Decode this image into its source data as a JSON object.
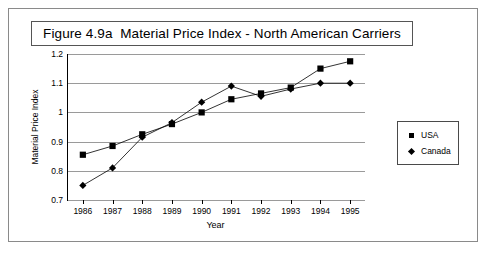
{
  "figure": {
    "title": "Figure 4.9a  Material Price Index - North American Carriers"
  },
  "legend": {
    "items": [
      {
        "label": "USA",
        "marker": "square-marker",
        "color": "#000000"
      },
      {
        "label": "Canada",
        "marker": "diamond-marker",
        "color": "#000000"
      }
    ]
  },
  "chart_data": {
    "type": "line",
    "title": "Figure 4.9a  Material Price Index - North American Carriers",
    "xlabel": "Year",
    "ylabel": "Material Price Index",
    "categories": [
      "1986",
      "1987",
      "1988",
      "1989",
      "1990",
      "1991",
      "1992",
      "1993",
      "1994",
      "1995"
    ],
    "x": [
      1986,
      1987,
      1988,
      1989,
      1990,
      1991,
      1992,
      1993,
      1994,
      1995
    ],
    "series": [
      {
        "name": "USA",
        "marker": "square",
        "values": [
          0.855,
          0.885,
          0.925,
          0.96,
          1.0,
          1.045,
          1.065,
          1.085,
          1.15,
          1.175
        ]
      },
      {
        "name": "Canada",
        "marker": "diamond",
        "values": [
          0.75,
          0.81,
          0.915,
          0.965,
          1.035,
          1.09,
          1.055,
          1.08,
          1.1,
          1.1
        ]
      }
    ],
    "ylim": [
      0.7,
      1.2
    ],
    "yticks": [
      0.7,
      0.8,
      0.9,
      1.0,
      1.1,
      1.2
    ],
    "ytick_labels": [
      "0.7",
      "0.8",
      "0.9",
      "1",
      "1.1",
      "1.2"
    ],
    "grid": true,
    "legend_position": "right"
  }
}
